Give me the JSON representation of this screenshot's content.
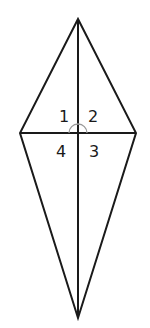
{
  "figure": {
    "type": "kite",
    "stroke_color": "#1a1a1a",
    "arc_color": "#9a9a9a",
    "vertices": {
      "top": [
        78,
        19
      ],
      "left": [
        20,
        133
      ],
      "right": [
        136,
        133
      ],
      "bottom": [
        78,
        318
      ]
    },
    "center": [
      78,
      133
    ],
    "angle_arc_radius": 9,
    "angle_labels": [
      {
        "id": "1",
        "text": "1",
        "x": 63,
        "y": 122
      },
      {
        "id": "2",
        "text": "2",
        "x": 93,
        "y": 122
      },
      {
        "id": "4",
        "text": "4",
        "x": 61,
        "y": 157
      },
      {
        "id": "3",
        "text": "3",
        "x": 94,
        "y": 157
      }
    ]
  }
}
